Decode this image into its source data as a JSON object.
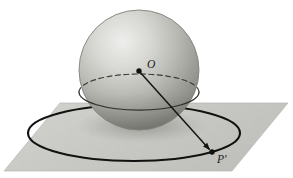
{
  "figure": {
    "background_color": "#ffffff",
    "width": 293,
    "height": 178,
    "labels": [
      {
        "id": "center-label",
        "text": "O",
        "meaning": "center of the sphere",
        "x": 147,
        "y": 68,
        "font_size": 11
      },
      {
        "id": "projected-point-label",
        "text": "P'",
        "meaning": "projected point on the plane",
        "x": 217,
        "y": 162,
        "font_size": 11
      }
    ],
    "sphere": {
      "name": "sphere",
      "center_x": 139,
      "center_y": 70,
      "radius": 60,
      "fill_light": "#e9e9e7",
      "fill_mid": "#b3b3ae",
      "fill_dark": "#8d8d88",
      "outline_color": "#7d7d78"
    },
    "plane": {
      "name": "ground-plane",
      "fill": "#cbcbc8",
      "edge_color": "#b8b8b4",
      "corners": [
        {
          "x": 60,
          "y": 103
        },
        {
          "x": 288,
          "y": 103
        },
        {
          "x": 232,
          "y": 171
        },
        {
          "x": 4,
          "y": 171
        }
      ]
    },
    "plane_circle": {
      "name": "plane-circle",
      "center_x": 134,
      "center_y": 133,
      "rx": 106,
      "ry": 28,
      "stroke": "#111111",
      "stroke_width": 2.1
    },
    "equator": {
      "name": "sphere-equator",
      "center_x": 139,
      "center_y": 92,
      "rx": 60,
      "ry": 18,
      "stroke": "#3a3a38",
      "stroke_width": 1.2,
      "back_style": "dashed",
      "front_style": "solid"
    },
    "ray": {
      "name": "projection-ray",
      "from_x": 139,
      "from_y": 71,
      "to_x": 212,
      "to_y": 152,
      "stroke": "#141414",
      "stroke_width": 1.5,
      "arrowhead": true
    },
    "points": [
      {
        "id": "center-dot",
        "name": "sphere-center-point",
        "x": 139,
        "y": 71,
        "r": 2.6,
        "fill": "#111111"
      },
      {
        "id": "projected-dot",
        "name": "projected-point",
        "x": 212,
        "y": 152,
        "r": 2.6,
        "fill": "#111111"
      }
    ]
  }
}
